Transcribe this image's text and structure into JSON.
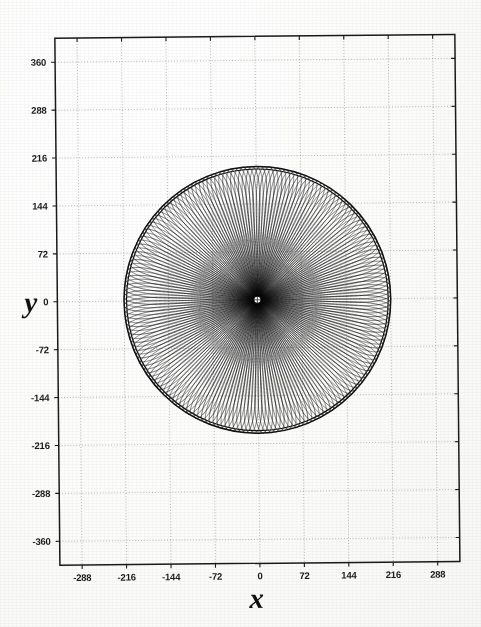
{
  "figure": {
    "type": "orbit-rosette-plot",
    "background_color": "#fdfdfc",
    "ink_color": "#111111",
    "grid_color": "#9a9a9a"
  },
  "axes": {
    "x_title": "x",
    "y_title": "y",
    "x_ticks": [
      "-288",
      "-216",
      "-144",
      "-72",
      "0",
      "72",
      "144",
      "216",
      "288"
    ],
    "y_ticks": [
      "360",
      "288",
      "216",
      "144",
      "72",
      "0",
      "-72",
      "-144",
      "-216",
      "-288",
      "-360"
    ],
    "frame_color": "#1a1a1a"
  },
  "chart_data": {
    "type": "line",
    "title": "",
    "subtitle": "",
    "xlabel": "x",
    "ylabel": "y",
    "xlim": [
      -324,
      324
    ],
    "ylim": [
      -396,
      396
    ],
    "xticks": [
      -288,
      -216,
      -144,
      -72,
      0,
      72,
      144,
      216,
      288
    ],
    "yticks": [
      360,
      288,
      216,
      144,
      72,
      0,
      -72,
      -144,
      -216,
      -288,
      -360
    ],
    "grid": true,
    "grid_style": "dotted",
    "legend": null,
    "aspect": "equal",
    "series": [
      {
        "name": "precessing orbit trajectory",
        "description": "Single continuous trajectory: a precessing (rosette) orbit whose apsides rotate, tracing elongated radial loops that grow with radius and fill a disk bounded by an outer circle.",
        "curve_family": "rosette / precessing ellipse",
        "r_min": 6,
        "r_max": 216,
        "outer_envelope_radius": 216,
        "inner_hole_radius": 6,
        "loop_count": 96,
        "precession_per_loop_deg": 3.75,
        "point_count": 24000
      },
      {
        "name": "outer bounding circles",
        "description": "Two nearly concentric heavy circles drawn at the apoapsis envelope.",
        "radii": [
          212,
          216
        ]
      }
    ]
  }
}
